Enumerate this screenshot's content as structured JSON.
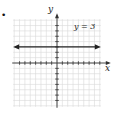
{
  "marker": "•",
  "labels": {
    "x_axis": "x",
    "y_axis": "y",
    "equation": "y = 3"
  },
  "colors": {
    "grid": "#d9d9d9",
    "axis": "#333333",
    "line": "#222222"
  },
  "chart_data": {
    "type": "line",
    "title": "",
    "xlabel": "x",
    "ylabel": "y",
    "xlim": [
      -8,
      8
    ],
    "ylim": [
      -8,
      8
    ],
    "grid": true,
    "series": [
      {
        "name": "y = 3",
        "x": [
          -8,
          8
        ],
        "values": [
          3,
          3
        ],
        "arrows_both_ends": true
      }
    ],
    "annotations": [
      "y = 3"
    ]
  }
}
